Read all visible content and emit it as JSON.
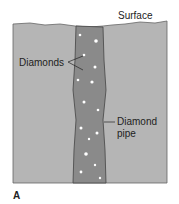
{
  "figure": {
    "labels": {
      "surface": "Surface",
      "diamonds": "Diamonds",
      "pipe_line1": "Diamond",
      "pipe_line2": "pipe"
    },
    "panel_label": "A",
    "colors": {
      "ground": "#b5b5b5",
      "pipe": "#8a8a8a",
      "diamond": "#ffffff",
      "outline": "#555555"
    }
  }
}
